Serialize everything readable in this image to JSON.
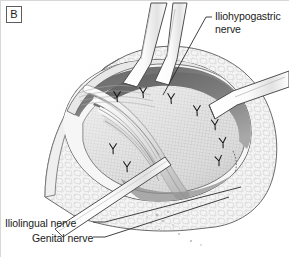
{
  "figure": {
    "panel_label": "B",
    "type": "surgical-illustration",
    "style": "grayscale line-and-tone medical drawing"
  },
  "labels": {
    "iliohypogastric": "Iliohypogastric\nnerve",
    "ilioinguinal": "Iliolingual nerve",
    "genital": "Genital nerve"
  },
  "colors": {
    "background": "#ffffff",
    "frame_border": "#d8d8d8",
    "ink": "#1a1a1a",
    "outline": "#4a4a4a",
    "fat_tissue": "#f2f2f2",
    "fat_shadow": "#cfcfcf",
    "mesh_fill": "#dcdcdc",
    "mesh_grid": "#b4b4b4",
    "deep_shadow": "#6e6e6e",
    "darkest_shadow": "#4b4b4b",
    "retractor_fill": "#fdfdfd",
    "nerve_fill": "#e6e6e6",
    "suture": "#161616",
    "leader_line": "#2a2a2a"
  },
  "anatomy": {
    "structures": [
      "subcutaneous fat wound edge",
      "prosthetic mesh with grid texture",
      "suture row along mesh border",
      "iliohypogastric nerve",
      "ilioinguinal nerve",
      "genital branch of genitofemoral nerve",
      "spermatic cord structures"
    ],
    "instruments": [
      "upper retractor blade",
      "second upper retractor blade",
      "right lateral retractor blade",
      "lower-left flat retractor band"
    ],
    "suture_count": 9
  }
}
